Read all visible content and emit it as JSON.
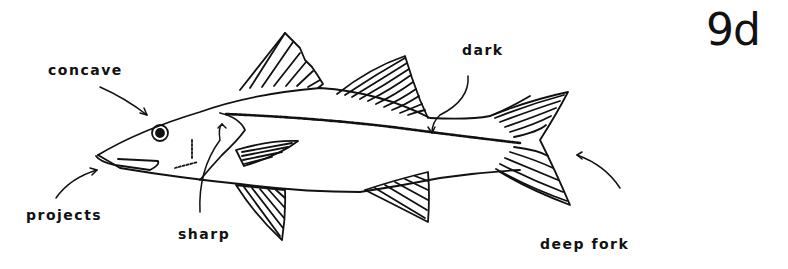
{
  "figure": {
    "id": "9d"
  },
  "labels": {
    "concave": "concave",
    "projects": "projects",
    "sharp": "sharp",
    "dark": "dark",
    "deep_fork": "deep fork"
  },
  "colors": {
    "ink": "#111111",
    "background": "#ffffff"
  }
}
